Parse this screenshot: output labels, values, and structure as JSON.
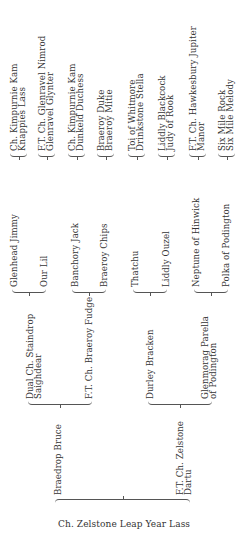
{
  "pedigree": {
    "root": "Ch. Zelstone Leap Year Lass",
    "parents": {
      "sire": "Braedrop Bruce",
      "dam_line1": "F.T. Ch. Zelstone",
      "dam_line2": "Dartu"
    },
    "grandparents": {
      "g1_line1": "Dual Ch. Staindrop",
      "g1_line2": "Saighdear",
      "g2": "F.T. Ch. Braeroy Fudge",
      "g3": "Durley Bracken",
      "g4_line1": "Glenmorag Parella",
      "g4_line2": "of Podington"
    },
    "great_grandparents": [
      "Glenhead Jimmy",
      "Our Lil",
      "Banchory Jack",
      "Braeroy Chips",
      "Thatchu",
      "Liddly Ouzel",
      "Neptune of Hinwick",
      "Polka of Podington"
    ],
    "great_great_grandparents": [
      [
        "Ch. Kimpurnie Kam",
        "Knappies Lass"
      ],
      [
        "F.T. Ch. Glenravel Nimrod",
        "Glenravel Glynter"
      ],
      [
        "Ch. Kimpurnie Kam",
        "Dunkeld Duchess"
      ],
      [
        "Braeroy Duke",
        "Braeroy Mitie"
      ],
      [
        "Toi of Whitmore",
        "Drinkstone Stella"
      ],
      [
        "Liddly Blackcock",
        "Judy of Rook"
      ],
      [
        "F.T. Ch. Hawkesbury Jupiter",
        "Manor"
      ],
      [
        "Six Mile Rock",
        "Six Mile Melody"
      ]
    ]
  }
}
